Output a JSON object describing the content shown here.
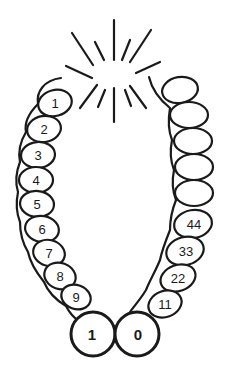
{
  "diagram": {
    "stroke_color": "#1a1a1a",
    "background": "#ffffff",
    "burst": {
      "ray_count": 12
    },
    "left_coil": {
      "labels": [
        "1",
        "2",
        "3",
        "4",
        "5",
        "6",
        "7",
        "8",
        "9"
      ]
    },
    "bottom_pair": {
      "left_label": "1",
      "right_label": "0"
    },
    "right_coil": {
      "labels": [
        "11",
        "22",
        "33",
        "44"
      ],
      "unlabeled_loops": 4
    }
  }
}
